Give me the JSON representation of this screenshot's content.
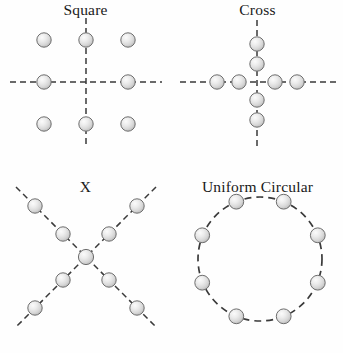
{
  "figure": {
    "width": 343,
    "height": 353,
    "background_color": "#fefefe",
    "layout": "2x2 grid of labelled sphere-arrangement diagrams"
  },
  "style": {
    "sphere_fill_light": "#f2f2f2",
    "sphere_fill_mid": "#d6d6d6",
    "sphere_fill_dark": "#b4b4b4",
    "sphere_outline": "#6e6e6e",
    "line_color": "#3a3a3a",
    "text_color": "#191919",
    "sphere_radius": 7.2,
    "dash_pattern": "6 4"
  },
  "panels": [
    {
      "id": "square",
      "title": "Square",
      "dot_count": 8,
      "center": [
        86,
        82
      ],
      "spacing": 42,
      "guides": [
        {
          "type": "line",
          "x1": 10,
          "y1": 82,
          "x2": 162,
          "y2": 82
        },
        {
          "type": "line",
          "x1": 86,
          "y1": 18,
          "x2": 86,
          "y2": 148
        }
      ],
      "dots": [
        [
          44,
          40
        ],
        [
          86,
          40
        ],
        [
          128,
          40
        ],
        [
          44,
          82
        ],
        [
          128,
          82
        ],
        [
          44,
          124
        ],
        [
          86,
          124
        ],
        [
          128,
          124
        ]
      ]
    },
    {
      "id": "cross",
      "title": "Cross",
      "dot_count": 8,
      "center": [
        85,
        82
      ],
      "spacing": 16,
      "guides": [
        {
          "type": "line",
          "x1": 8,
          "y1": 82,
          "x2": 164,
          "y2": 82
        },
        {
          "type": "line",
          "x1": 85,
          "y1": 20,
          "x2": 85,
          "y2": 146
        }
      ],
      "dots": [
        [
          85,
          44
        ],
        [
          85,
          64
        ],
        [
          85,
          100
        ],
        [
          85,
          120
        ],
        [
          45,
          82
        ],
        [
          67,
          82
        ],
        [
          103,
          82
        ],
        [
          125,
          82
        ]
      ]
    },
    {
      "id": "x",
      "title": "X",
      "dot_count": 9,
      "center": [
        86,
        80
      ],
      "spacing": 30,
      "guides": [
        {
          "type": "line",
          "x1": 16,
          "y1": 10,
          "x2": 156,
          "y2": 150
        },
        {
          "type": "line",
          "x1": 156,
          "y1": 10,
          "x2": 16,
          "y2": 150
        }
      ],
      "dots": [
        [
          86,
          80
        ],
        [
          63,
          57
        ],
        [
          35,
          29
        ],
        [
          109,
          57
        ],
        [
          137,
          29
        ],
        [
          63,
          103
        ],
        [
          35,
          131
        ],
        [
          109,
          103
        ],
        [
          137,
          131
        ]
      ]
    },
    {
      "id": "circular",
      "title": "Uniform Circular",
      "dot_count": 8,
      "center": [
        88,
        82
      ],
      "radius": 62,
      "angle_offset_deg": 22.5,
      "guides": [
        {
          "type": "circle",
          "cx": 88,
          "cy": 82,
          "r": 62
        }
      ],
      "dots": [
        [
          112,
          25
        ],
        [
          145,
          58
        ],
        [
          145,
          105
        ],
        [
          112,
          139
        ],
        [
          64,
          139
        ],
        [
          31,
          105
        ],
        [
          31,
          58
        ],
        [
          64,
          25
        ]
      ]
    }
  ]
}
